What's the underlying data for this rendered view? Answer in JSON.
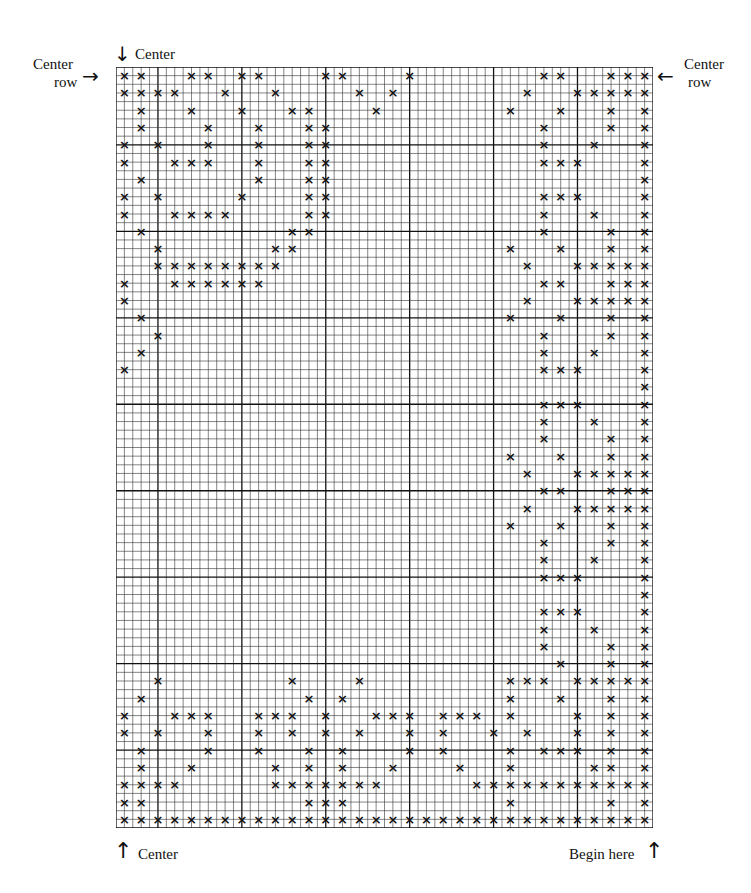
{
  "labels": {
    "center_top": "Center",
    "center_row_left_line1": "Center",
    "center_row_left_line2": "row",
    "center_row_right_line1": "Center",
    "center_row_right_line2": "row",
    "center_bottom": "Center",
    "begin_here": "Begin here"
  },
  "icons": {
    "arrow_down": "↓",
    "arrow_right": "→",
    "arrow_left": "←",
    "arrow_up": "↑"
  },
  "grid": {
    "fine_columns": 64,
    "fine_rows": 88,
    "stitch_columns": 32,
    "stitch_rows": 44,
    "stitch_symbol": "×",
    "line_color": "#333333",
    "heavy_line_color": "#111111",
    "stitch_color": "#111111",
    "rows": [
      [
        0,
        1,
        4,
        5,
        7,
        8,
        12,
        13,
        17,
        25,
        26,
        29,
        30,
        31
      ],
      [
        0,
        1,
        2,
        3,
        6,
        9,
        14,
        16,
        24,
        27,
        28,
        29,
        30,
        31
      ],
      [
        1,
        4,
        7,
        10,
        11,
        15,
        23,
        26,
        29,
        31
      ],
      [
        1,
        5,
        8,
        11,
        12,
        25,
        29,
        31
      ],
      [
        0,
        2,
        5,
        8,
        11,
        12,
        25,
        28,
        31
      ],
      [
        0,
        3,
        4,
        5,
        8,
        11,
        12,
        25,
        26,
        27,
        31
      ],
      [
        1,
        8,
        11,
        12,
        31
      ],
      [
        0,
        2,
        7,
        11,
        12,
        25,
        26,
        27,
        31
      ],
      [
        0,
        3,
        4,
        5,
        6,
        11,
        12,
        25,
        28,
        31
      ],
      [
        1,
        10,
        11,
        25,
        29,
        31
      ],
      [
        2,
        9,
        10,
        23,
        26,
        29,
        31
      ],
      [
        2,
        3,
        4,
        5,
        6,
        7,
        8,
        9,
        24,
        27,
        28,
        29,
        30,
        31
      ],
      [
        0,
        3,
        4,
        5,
        6,
        7,
        8,
        25,
        26,
        29,
        30,
        31
      ],
      [
        0,
        24,
        27,
        28,
        29,
        30,
        31
      ],
      [
        1,
        23,
        26,
        29,
        31
      ],
      [
        2,
        25,
        29,
        31
      ],
      [
        1,
        25,
        28,
        31
      ],
      [
        0,
        25,
        26,
        27,
        31
      ],
      [
        31
      ],
      [
        25,
        26,
        27,
        31
      ],
      [
        25,
        28,
        31
      ],
      [
        25,
        29,
        31
      ],
      [
        23,
        26,
        29,
        31
      ],
      [
        24,
        27,
        28,
        29,
        30,
        31
      ],
      [
        25,
        26,
        29,
        30,
        31
      ],
      [
        24,
        27,
        28,
        29,
        30,
        31
      ],
      [
        23,
        26,
        29,
        31
      ],
      [
        25,
        29,
        31
      ],
      [
        25,
        28,
        31
      ],
      [
        25,
        26,
        27,
        31
      ],
      [
        31
      ],
      [
        25,
        26,
        27,
        31
      ],
      [
        25,
        28,
        31
      ],
      [
        25,
        29,
        31
      ],
      [
        26,
        29,
        31
      ],
      [
        2,
        10,
        14,
        23,
        24,
        25,
        27,
        28,
        29,
        30,
        31
      ],
      [
        1,
        11,
        13,
        23,
        26,
        29,
        31
      ],
      [
        0,
        3,
        4,
        5,
        8,
        9,
        10,
        12,
        15,
        16,
        17,
        19,
        20,
        21,
        23,
        27,
        29,
        31
      ],
      [
        0,
        2,
        5,
        8,
        10,
        12,
        14,
        17,
        19,
        22,
        24,
        27,
        29,
        31
      ],
      [
        1,
        5,
        8,
        11,
        13,
        17,
        19,
        23,
        25,
        26,
        27,
        29,
        31
      ],
      [
        1,
        4,
        9,
        11,
        13,
        16,
        20,
        23,
        28,
        29,
        31
      ],
      [
        0,
        1,
        2,
        3,
        9,
        10,
        11,
        12,
        13,
        14,
        15,
        21,
        22,
        23,
        24,
        25,
        26,
        27,
        28,
        29,
        30,
        31
      ],
      [
        0,
        1,
        11,
        12,
        13,
        23,
        29,
        31
      ],
      [
        0,
        1,
        2,
        3,
        4,
        5,
        6,
        7,
        8,
        9,
        10,
        11,
        12,
        13,
        14,
        15,
        16,
        17,
        18,
        19,
        20,
        21,
        22,
        23,
        24,
        25,
        26,
        27,
        28,
        29,
        30,
        31
      ]
    ]
  }
}
